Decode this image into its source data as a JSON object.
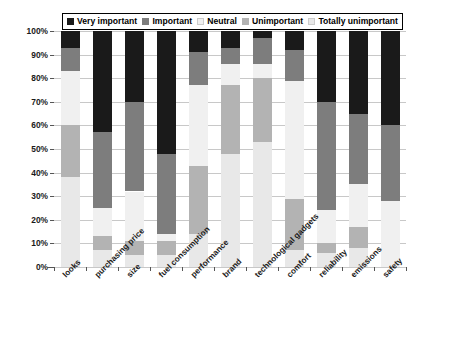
{
  "chart_data": {
    "type": "bar",
    "subtype": "stacked-bar-100-percent",
    "title": "",
    "xlabel": "",
    "ylabel": "",
    "ylim": [
      0,
      100
    ],
    "yticks": [
      "0%",
      "10%",
      "20%",
      "30%",
      "40%",
      "50%",
      "60%",
      "70%",
      "80%",
      "90%",
      "100%"
    ],
    "grid": true,
    "legend_position": "top",
    "categories": [
      "looks",
      "purchasing price",
      "size",
      "fuel consumption",
      "performance",
      "brand",
      "technological gadgets",
      "comfort",
      "reliability",
      "emissions",
      "safety"
    ],
    "series": [
      {
        "name": "Very important",
        "color": "#1a1a1a",
        "values": [
          7,
          43,
          30,
          52,
          9,
          7,
          3,
          8,
          30,
          35,
          40
        ]
      },
      {
        "name": "Important",
        "color": "#7d7d7d",
        "values": [
          10,
          32,
          38,
          34,
          14,
          7,
          11,
          13,
          46,
          30,
          32
        ]
      },
      {
        "name": "Neutral",
        "color": "#f0f0f0",
        "values": [
          23,
          12,
          21,
          3,
          34,
          9,
          6,
          50,
          14,
          18,
          28
        ]
      },
      {
        "name": "Unimportant",
        "color": "#b3b3b3",
        "values": [
          22,
          6,
          6,
          6,
          29,
          29,
          27,
          22,
          4,
          9,
          0
        ]
      },
      {
        "name": "Totally unimportant",
        "color": "#e8e8e8",
        "values": [
          38,
          7,
          5,
          5,
          14,
          48,
          53,
          7,
          6,
          8,
          0
        ]
      }
    ]
  },
  "legend": {
    "items": [
      {
        "label": "Very important",
        "color": "#1a1a1a"
      },
      {
        "label": "Important",
        "color": "#7d7d7d"
      },
      {
        "label": "Neutral",
        "color": "#f0f0f0"
      },
      {
        "label": "Unimportant",
        "color": "#b3b3b3"
      },
      {
        "label": "Totally unimportant",
        "color": "#e8e8e8"
      }
    ]
  }
}
